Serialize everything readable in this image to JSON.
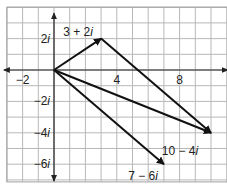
{
  "diagram": {
    "type": "complex-plane-vectors",
    "origin_px": [
      54,
      70
    ],
    "unit_px": 15.7,
    "grid": {
      "x_range": [
        -3,
        11
      ],
      "y_range": [
        -7,
        4
      ],
      "line_color": "#b8b8b8",
      "border_color": "#a0a0a0"
    },
    "axis_color": "#222222",
    "arrow_color": "#111111",
    "x_ticks": [
      {
        "value": -2,
        "label": "−2"
      },
      {
        "value": 4,
        "label": "4"
      },
      {
        "value": 8,
        "label": "8"
      }
    ],
    "y_ticks": [
      {
        "value": 2,
        "label": "2",
        "suffix": "i"
      },
      {
        "value": -2,
        "label": "−2",
        "suffix": "i"
      },
      {
        "value": -4,
        "label": "−4",
        "suffix": "i"
      },
      {
        "value": -6,
        "label": "−6",
        "suffix": "i"
      }
    ],
    "vectors": [
      {
        "from": [
          0,
          0
        ],
        "to": [
          3,
          2
        ]
      },
      {
        "from": [
          3,
          2
        ],
        "to": [
          10,
          -4
        ]
      },
      {
        "from": [
          0,
          0
        ],
        "to": [
          10,
          -4
        ]
      },
      {
        "from": [
          0,
          0
        ],
        "to": [
          7,
          -6
        ]
      }
    ],
    "point_labels": [
      {
        "text": "3 + 2",
        "suffix": "i",
        "x": 78,
        "y": 36
      },
      {
        "text": "10 − 4",
        "suffix": "i",
        "x": 180,
        "y": 155
      },
      {
        "text": "7 − 6",
        "suffix": "i",
        "x": 143,
        "y": 180
      }
    ]
  }
}
